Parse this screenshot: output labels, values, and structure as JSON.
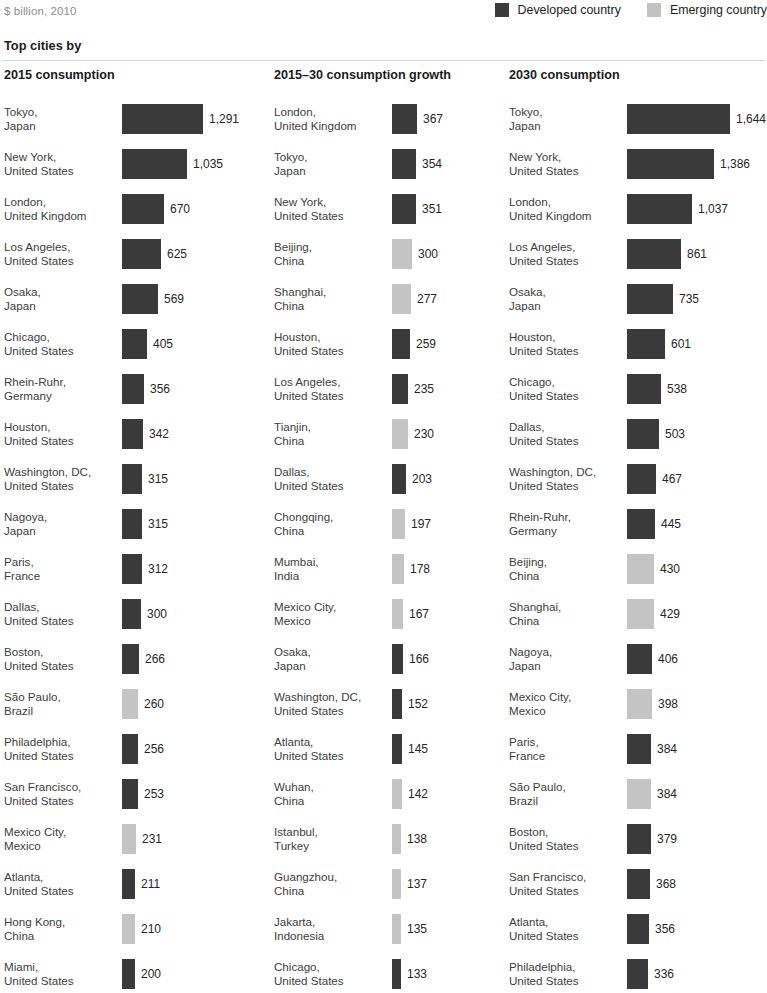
{
  "header": {
    "unit_note": "$ billion, 2010",
    "section_title": "Top cities by"
  },
  "legend": {
    "items": [
      {
        "label": "Developed country",
        "swatch": "dark",
        "color": "#3a3a3a"
      },
      {
        "label": "Emerging country",
        "swatch": "light",
        "color": "#c2c2c2"
      }
    ]
  },
  "chart_data": {
    "type": "bar",
    "title": "Top cities by",
    "subtitle": "$ billion, 2010",
    "legend": [
      "Developed country",
      "Emerging country"
    ],
    "legend_position": "top-right",
    "grid": false,
    "xlabel": "",
    "ylabel": "",
    "panels": [
      {
        "header": "2015 consumption",
        "max_value": 1291,
        "categories": [
          "Tokyo, Japan",
          "New York, United States",
          "London, United Kingdom",
          "Los Angeles, United States",
          "Osaka, Japan",
          "Chicago, United States",
          "Rhein-Ruhr, Germany",
          "Houston, United States",
          "Washington, DC, United States",
          "Nagoya, Japan",
          "Paris, France",
          "Dallas, United States",
          "Boston, United States",
          "São Paulo, Brazil",
          "Philadelphia, United States",
          "San Francisco, United States",
          "Mexico City, Mexico",
          "Atlanta, United States",
          "Hong Kong, China",
          "Miami, United States"
        ],
        "values": [
          1291,
          1035,
          670,
          625,
          569,
          405,
          356,
          342,
          315,
          315,
          312,
          300,
          266,
          260,
          256,
          253,
          231,
          211,
          210,
          200
        ],
        "rows": [
          {
            "city": "Tokyo,",
            "country": "Japan",
            "value": 1291,
            "label": "1,291",
            "type": "dark"
          },
          {
            "city": "New York,",
            "country": "United States",
            "value": 1035,
            "label": "1,035",
            "type": "dark"
          },
          {
            "city": "London,",
            "country": "United Kingdom",
            "value": 670,
            "label": "670",
            "type": "dark"
          },
          {
            "city": "Los Angeles,",
            "country": "United States",
            "value": 625,
            "label": "625",
            "type": "dark"
          },
          {
            "city": "Osaka,",
            "country": "Japan",
            "value": 569,
            "label": "569",
            "type": "dark"
          },
          {
            "city": "Chicago,",
            "country": "United States",
            "value": 405,
            "label": "405",
            "type": "dark"
          },
          {
            "city": "Rhein-Ruhr,",
            "country": "Germany",
            "value": 356,
            "label": "356",
            "type": "dark"
          },
          {
            "city": "Houston,",
            "country": "United States",
            "value": 342,
            "label": "342",
            "type": "dark"
          },
          {
            "city": "Washington, DC,",
            "country": "United States",
            "value": 315,
            "label": "315",
            "type": "dark"
          },
          {
            "city": "Nagoya,",
            "country": "Japan",
            "value": 315,
            "label": "315",
            "type": "dark"
          },
          {
            "city": "Paris,",
            "country": "France",
            "value": 312,
            "label": "312",
            "type": "dark"
          },
          {
            "city": "Dallas,",
            "country": "United States",
            "value": 300,
            "label": "300",
            "type": "dark"
          },
          {
            "city": "Boston,",
            "country": "United States",
            "value": 266,
            "label": "266",
            "type": "dark"
          },
          {
            "city": "São Paulo,",
            "country": "Brazil",
            "value": 260,
            "label": "260",
            "type": "light"
          },
          {
            "city": "Philadelphia,",
            "country": "United States",
            "value": 256,
            "label": "256",
            "type": "dark"
          },
          {
            "city": "San Francisco,",
            "country": "United States",
            "value": 253,
            "label": "253",
            "type": "dark"
          },
          {
            "city": "Mexico City,",
            "country": "Mexico",
            "value": 231,
            "label": "231",
            "type": "light"
          },
          {
            "city": "Atlanta,",
            "country": "United States",
            "value": 211,
            "label": "211",
            "type": "dark"
          },
          {
            "city": "Hong Kong,",
            "country": "China",
            "value": 210,
            "label": "210",
            "type": "light"
          },
          {
            "city": "Miami,",
            "country": "United States",
            "value": 200,
            "label": "200",
            "type": "dark"
          }
        ]
      },
      {
        "header": "2015–30 consumption growth",
        "max_value": 367,
        "categories": [
          "London, United Kingdom",
          "Tokyo, Japan",
          "New York, United States",
          "Beijing, China",
          "Shanghai, China",
          "Houston, United States",
          "Los Angeles, United States",
          "Tianjin, China",
          "Dallas, United States",
          "Chongqing, China",
          "Mumbai, India",
          "Mexico City, Mexico",
          "Osaka, Japan",
          "Washington, DC, United States",
          "Atlanta, United States",
          "Wuhan, China",
          "Istanbul, Turkey",
          "Guangzhou, China",
          "Jakarta, Indonesia",
          "Chicago, United States"
        ],
        "values": [
          367,
          354,
          351,
          300,
          277,
          259,
          235,
          230,
          203,
          197,
          178,
          167,
          166,
          152,
          145,
          142,
          138,
          137,
          135,
          133
        ],
        "rows": [
          {
            "city": "London,",
            "country": "United Kingdom",
            "value": 367,
            "label": "367",
            "type": "dark"
          },
          {
            "city": "Tokyo,",
            "country": "Japan",
            "value": 354,
            "label": "354",
            "type": "dark"
          },
          {
            "city": "New York,",
            "country": "United States",
            "value": 351,
            "label": "351",
            "type": "dark"
          },
          {
            "city": "Beijing,",
            "country": "China",
            "value": 300,
            "label": "300",
            "type": "light"
          },
          {
            "city": "Shanghai,",
            "country": "China",
            "value": 277,
            "label": "277",
            "type": "light"
          },
          {
            "city": "Houston,",
            "country": "United States",
            "value": 259,
            "label": "259",
            "type": "dark"
          },
          {
            "city": "Los Angeles,",
            "country": "United States",
            "value": 235,
            "label": "235",
            "type": "dark"
          },
          {
            "city": "Tianjin,",
            "country": "China",
            "value": 230,
            "label": "230",
            "type": "light"
          },
          {
            "city": "Dallas,",
            "country": "United States",
            "value": 203,
            "label": "203",
            "type": "dark"
          },
          {
            "city": "Chongqing,",
            "country": "China",
            "value": 197,
            "label": "197",
            "type": "light"
          },
          {
            "city": "Mumbai,",
            "country": "India",
            "value": 178,
            "label": "178",
            "type": "light"
          },
          {
            "city": "Mexico City,",
            "country": "Mexico",
            "value": 167,
            "label": "167",
            "type": "light"
          },
          {
            "city": "Osaka,",
            "country": "Japan",
            "value": 166,
            "label": "166",
            "type": "dark"
          },
          {
            "city": "Washington, DC,",
            "country": "United States",
            "value": 152,
            "label": "152",
            "type": "dark"
          },
          {
            "city": "Atlanta,",
            "country": "United States",
            "value": 145,
            "label": "145",
            "type": "dark"
          },
          {
            "city": "Wuhan,",
            "country": "China",
            "value": 142,
            "label": "142",
            "type": "light"
          },
          {
            "city": "Istanbul,",
            "country": "Turkey",
            "value": 138,
            "label": "138",
            "type": "light"
          },
          {
            "city": "Guangzhou,",
            "country": "China",
            "value": 137,
            "label": "137",
            "type": "light"
          },
          {
            "city": "Jakarta,",
            "country": "Indonesia",
            "value": 135,
            "label": "135",
            "type": "light"
          },
          {
            "city": "Chicago,",
            "country": "United States",
            "value": 133,
            "label": "133",
            "type": "dark"
          }
        ]
      },
      {
        "header": "2030 consumption",
        "max_value": 1644,
        "categories": [
          "Tokyo, Japan",
          "New York, United States",
          "London, United Kingdom",
          "Los Angeles, United States",
          "Osaka, Japan",
          "Houston, United States",
          "Chicago, United States",
          "Dallas, United States",
          "Washington, DC, United States",
          "Rhein-Ruhr, Germany",
          "Beijing, China",
          "Shanghai, China",
          "Nagoya, Japan",
          "Mexico City, Mexico",
          "Paris, France",
          "São Paulo, Brazil",
          "Boston, United States",
          "San Francisco, United States",
          "Atlanta, United States",
          "Philadelphia, United States"
        ],
        "values": [
          1644,
          1386,
          1037,
          861,
          735,
          601,
          538,
          503,
          467,
          445,
          430,
          429,
          406,
          398,
          384,
          384,
          379,
          368,
          356,
          336
        ],
        "rows": [
          {
            "city": "Tokyo,",
            "country": "Japan",
            "value": 1644,
            "label": "1,644",
            "type": "dark"
          },
          {
            "city": "New York,",
            "country": "United States",
            "value": 1386,
            "label": "1,386",
            "type": "dark"
          },
          {
            "city": "London,",
            "country": "United Kingdom",
            "value": 1037,
            "label": "1,037",
            "type": "dark"
          },
          {
            "city": "Los Angeles,",
            "country": "United States",
            "value": 861,
            "label": "861",
            "type": "dark"
          },
          {
            "city": "Osaka,",
            "country": "Japan",
            "value": 735,
            "label": "735",
            "type": "dark"
          },
          {
            "city": "Houston,",
            "country": "United States",
            "value": 601,
            "label": "601",
            "type": "dark"
          },
          {
            "city": "Chicago,",
            "country": "United States",
            "value": 538,
            "label": "538",
            "type": "dark"
          },
          {
            "city": "Dallas,",
            "country": "United States",
            "value": 503,
            "label": "503",
            "type": "dark"
          },
          {
            "city": "Washington, DC,",
            "country": "United States",
            "value": 467,
            "label": "467",
            "type": "dark"
          },
          {
            "city": "Rhein-Ruhr,",
            "country": "Germany",
            "value": 445,
            "label": "445",
            "type": "dark"
          },
          {
            "city": "Beijing,",
            "country": "China",
            "value": 430,
            "label": "430",
            "type": "light"
          },
          {
            "city": "Shanghai,",
            "country": "China",
            "value": 429,
            "label": "429",
            "type": "light"
          },
          {
            "city": "Nagoya,",
            "country": "Japan",
            "value": 406,
            "label": "406",
            "type": "dark"
          },
          {
            "city": "Mexico City,",
            "country": "Mexico",
            "value": 398,
            "label": "398",
            "type": "light"
          },
          {
            "city": "Paris,",
            "country": "France",
            "value": 384,
            "label": "384",
            "type": "dark"
          },
          {
            "city": "São Paulo,",
            "country": "Brazil",
            "value": 384,
            "label": "384",
            "type": "light"
          },
          {
            "city": "Boston,",
            "country": "United States",
            "value": 379,
            "label": "379",
            "type": "dark"
          },
          {
            "city": "San Francisco,",
            "country": "United States",
            "value": 368,
            "label": "368",
            "type": "dark"
          },
          {
            "city": "Atlanta,",
            "country": "United States",
            "value": 356,
            "label": "356",
            "type": "dark"
          },
          {
            "city": "Philadelphia,",
            "country": "United States",
            "value": 336,
            "label": "336",
            "type": "dark"
          }
        ]
      }
    ]
  }
}
